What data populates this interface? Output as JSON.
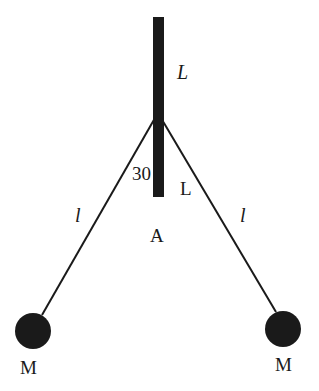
{
  "diagram": {
    "type": "physics-double-pendulum-rod",
    "colors": {
      "background": "#ffffff",
      "ink": "#1a1a1a"
    },
    "rod": {
      "x": 153,
      "y_top": 17,
      "width": 11,
      "y_bottom": 197
    },
    "pivot": {
      "x": 158,
      "y": 118
    },
    "labels": {
      "rod_upper_length": "L",
      "rod_lower_length": "L",
      "angle": "30",
      "point_a": "A",
      "string_left": "l",
      "string_right": "l",
      "mass_left": "M",
      "mass_right": "M"
    },
    "masses": [
      {
        "name": "left",
        "cx": 33,
        "cy": 331,
        "r": 18
      },
      {
        "name": "right",
        "cx": 283,
        "cy": 329,
        "r": 18
      }
    ]
  }
}
